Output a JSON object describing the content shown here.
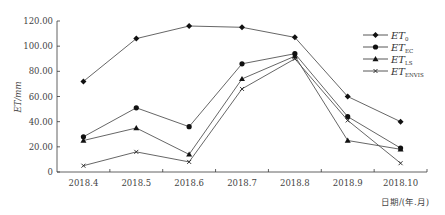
{
  "chart_data": {
    "type": "line",
    "title": "",
    "xlabel": "日期/(年.月)",
    "ylabel": "ET/mm",
    "ylim": [
      0,
      120
    ],
    "yticks": [
      "0",
      "20.00",
      "40.00",
      "60.00",
      "80.00",
      "100.00",
      "120.00"
    ],
    "categories": [
      "2018.4",
      "2018.5",
      "2018.6",
      "2018.7",
      "2018.8",
      "2018.9",
      "2018.10"
    ],
    "grid": false,
    "legend_position": "upper right",
    "series": [
      {
        "name": "ET0",
        "label_main": "ET",
        "label_sub": "0",
        "marker": "diamond",
        "values": [
          72,
          106,
          116,
          115,
          107,
          60,
          40
        ]
      },
      {
        "name": "ET_EC",
        "label_main": "ET",
        "label_sub": "EC",
        "marker": "circle",
        "values": [
          28,
          51,
          36,
          86,
          94,
          44,
          19
        ]
      },
      {
        "name": "ET_LS",
        "label_main": "ET",
        "label_sub": "LS",
        "marker": "triangle",
        "values": [
          25,
          35,
          14,
          74,
          92,
          25,
          18
        ]
      },
      {
        "name": "ET_ENVIS",
        "label_main": "ET",
        "label_sub": "ENVIS",
        "marker": "x",
        "values": [
          5,
          16,
          8,
          66,
          90,
          41,
          7
        ]
      }
    ]
  }
}
